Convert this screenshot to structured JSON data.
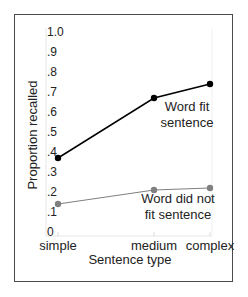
{
  "chart_data": {
    "type": "line",
    "title": "",
    "xlabel": "Sentence type",
    "ylabel": "Proportion recalled",
    "categories": [
      "simple",
      "medium",
      "complex"
    ],
    "y_ticks": [
      "0",
      ".1",
      ".2",
      ".3",
      ".4",
      ".5",
      ".6",
      ".7",
      ".8",
      ".9",
      "1.0"
    ],
    "ylim": [
      0,
      1.0
    ],
    "grid": false,
    "series": [
      {
        "name": "Word fit sentence",
        "label_lines": [
          "Word fit",
          "sentence"
        ],
        "values": [
          0.37,
          0.67,
          0.74
        ],
        "color": "#000000"
      },
      {
        "name": "Word did not fit sentence",
        "label_lines": [
          "Word did not",
          "fit sentence"
        ],
        "values": [
          0.14,
          0.21,
          0.22
        ],
        "color": "#808080"
      }
    ],
    "legend": "inline labels near lines"
  }
}
